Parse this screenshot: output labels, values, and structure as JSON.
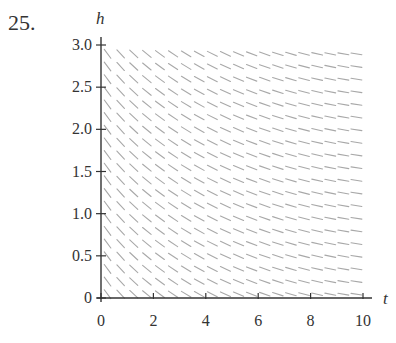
{
  "problem": {
    "number": "25."
  },
  "chart_data": {
    "type": "slope_field",
    "title": "",
    "xlabel": "t",
    "ylabel": "h",
    "xlim": [
      0,
      10
    ],
    "ylim": [
      0,
      3.0
    ],
    "x_ticks": [
      0,
      2,
      4,
      6,
      8,
      10
    ],
    "x_tick_labels": [
      "0",
      "2",
      "4",
      "6",
      "8",
      "10"
    ],
    "y_ticks": [
      0,
      0.5,
      1.0,
      1.5,
      2.0,
      2.5,
      3.0
    ],
    "y_tick_labels": [
      "0",
      "0.5",
      "1.0",
      "1.5",
      "2.0",
      "2.5",
      "3.0"
    ],
    "grid": false,
    "legend": null,
    "field": {
      "description": "Slopes depend only on t: steep negative near t=0, flattening toward 0 as t increases; independent of h",
      "t_step": 0.5,
      "h_step": 0.15,
      "segment_length_px": 11,
      "slope_at_t0_deg": -62,
      "slope_at_t10_deg": -8
    },
    "colors": {
      "segment": "#a8a8a8",
      "axis": "#333333"
    }
  }
}
